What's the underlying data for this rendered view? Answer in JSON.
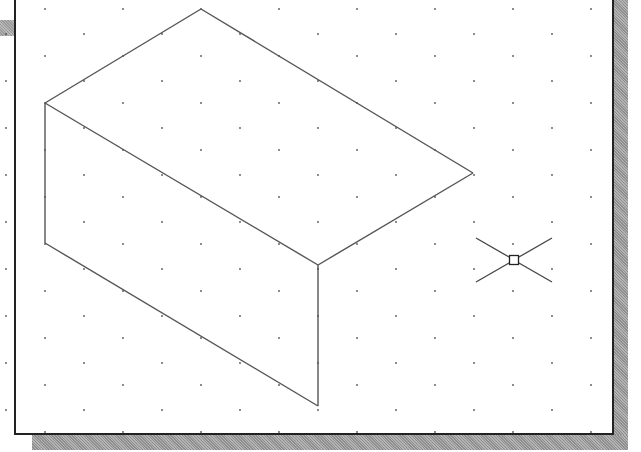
{
  "drawing_area": {
    "background": "#ffffff",
    "border_color": "#222222",
    "grid": {
      "type": "isometric",
      "dot_color": "#555555",
      "x_spacing": 39,
      "y_spacing": 23.5,
      "origin_x": 18,
      "origin_y": 7
    },
    "isometric_box": {
      "line_color": "#555555",
      "vertices": {
        "top": [
          213,
          7
        ],
        "left_top": [
          57,
          101
        ],
        "right": [
          485,
          171
        ],
        "front_top": [
          330,
          263
        ],
        "left_bottom": [
          57,
          241
        ],
        "front_bottom": [
          330,
          404
        ]
      }
    },
    "cursor": {
      "type": "isometric-crosshair-pickbox",
      "center": [
        526,
        258
      ],
      "pickbox_size": 9,
      "arm_dx": 38,
      "arm_dy": 22
    }
  }
}
